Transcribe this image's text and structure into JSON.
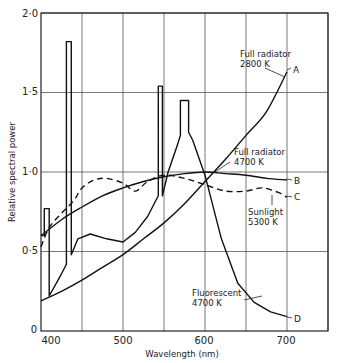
{
  "chart_data": {
    "type": "line",
    "title": "",
    "xlabel": "Wavelength (nm)",
    "ylabel": "Relative spectral power",
    "xlim": [
      400,
      750
    ],
    "ylim": [
      0,
      2.0
    ],
    "grid": true,
    "x_ticks": [
      400,
      500,
      600,
      700
    ],
    "x_tick_labels": [
      "400",
      "500",
      "600",
      "700"
    ],
    "y_ticks": [
      0,
      0.5,
      1.0,
      1.5,
      2.0
    ],
    "y_tick_labels": [
      "0",
      "0·5",
      "1·0",
      "1·5",
      "2·0"
    ],
    "grid_x": [
      450,
      500,
      550,
      600,
      650,
      700,
      750
    ],
    "grid_y": [
      0.5,
      1.0,
      1.5,
      2.0
    ],
    "legend": "inline labels",
    "series": [
      {
        "name": "Full radiator 2800 K",
        "label": [
          "Full radiator",
          "2800  K"
        ],
        "end_marker": "A",
        "style": "solid",
        "x": [
          400,
          425,
          450,
          475,
          500,
          525,
          550,
          575,
          600,
          625,
          650,
          675,
          700
        ],
        "y": [
          0.19,
          0.25,
          0.32,
          0.4,
          0.48,
          0.58,
          0.68,
          0.8,
          0.94,
          1.08,
          1.23,
          1.38,
          1.63
        ]
      },
      {
        "name": "Full radiator 4700 K",
        "label": [
          "Full radiator",
          "4700  K"
        ],
        "end_marker": "B",
        "style": "solid",
        "x": [
          400,
          425,
          450,
          475,
          500,
          525,
          550,
          575,
          600,
          625,
          650,
          675,
          700
        ],
        "y": [
          0.6,
          0.7,
          0.78,
          0.85,
          0.9,
          0.94,
          0.97,
          0.99,
          1.0,
          0.99,
          0.98,
          0.96,
          0.95
        ]
      },
      {
        "name": "Sunlight 5300 K",
        "label": [
          "Sunlight",
          "5300  K"
        ],
        "end_marker": "C",
        "style": "dashed",
        "x": [
          400,
          410,
          425,
          440,
          450,
          465,
          480,
          500,
          515,
          530,
          550,
          575,
          600,
          625,
          650,
          670,
          690,
          700
        ],
        "y": [
          0.53,
          0.65,
          0.74,
          0.82,
          0.9,
          0.95,
          0.96,
          0.93,
          0.88,
          0.94,
          0.98,
          0.96,
          0.92,
          0.88,
          0.88,
          0.9,
          0.87,
          0.84
        ]
      },
      {
        "name": "Fluorescent 4700 K",
        "label": [
          "Fluorescent",
          "4700  K"
        ],
        "end_marker": "D",
        "style": "solid",
        "x": [
          400,
          404,
          404,
          410,
          410,
          425,
          431,
          431,
          437,
          437,
          445,
          460,
          480,
          500,
          515,
          530,
          543,
          543,
          548,
          548,
          555,
          567,
          570,
          570,
          580,
          580,
          585,
          600,
          620,
          640,
          660,
          680,
          700
        ],
        "y": [
          0.6,
          0.6,
          0.77,
          0.77,
          0.22,
          0.36,
          0.42,
          1.82,
          1.82,
          0.48,
          0.58,
          0.61,
          0.58,
          0.56,
          0.62,
          0.72,
          0.85,
          1.54,
          1.54,
          0.85,
          1.0,
          1.18,
          1.23,
          1.45,
          1.45,
          1.25,
          1.2,
          0.98,
          0.58,
          0.3,
          0.18,
          0.12,
          0.09
        ]
      }
    ],
    "annotations": [
      {
        "text": "Full radiator",
        "x": 640,
        "y": 1.77
      },
      {
        "text": "2800  K",
        "x": 640,
        "y": 1.7
      },
      {
        "text": "Full radiator",
        "x": 655,
        "y": 1.11
      },
      {
        "text": "4700  K",
        "x": 655,
        "y": 1.04
      },
      {
        "text": "Sunlight",
        "x": 645,
        "y": 0.82
      },
      {
        "text": "5300  K",
        "x": 645,
        "y": 0.75
      },
      {
        "text": "Fluorescent",
        "x": 595,
        "y": 0.23
      },
      {
        "text": "4700  K",
        "x": 595,
        "y": 0.16
      },
      {
        "text": "A",
        "x": 705,
        "y": 1.64
      },
      {
        "text": "B",
        "x": 705,
        "y": 0.95
      },
      {
        "text": "C",
        "x": 705,
        "y": 0.84
      },
      {
        "text": "D",
        "x": 705,
        "y": 0.09
      }
    ]
  },
  "labels": {
    "xlabel": "Wavelength (nm)",
    "ylabel": "Relative spectral power",
    "y0": "0",
    "y05": "0·5",
    "y10": "1·0",
    "y15": "1·5",
    "y20": "2·0",
    "x400": "400",
    "x500": "500",
    "x600": "600",
    "x700": "700",
    "a": "A",
    "b": "B",
    "c": "C",
    "d": "D",
    "fr2800_1": "Full radiator",
    "fr2800_2": "2800  K",
    "fr4700_1": "Full radiator",
    "fr4700_2": "4700  K",
    "sun_1": "Sunlight",
    "sun_2": "5300  K",
    "fl_1": "Fluorescent",
    "fl_2": "4700  K"
  }
}
